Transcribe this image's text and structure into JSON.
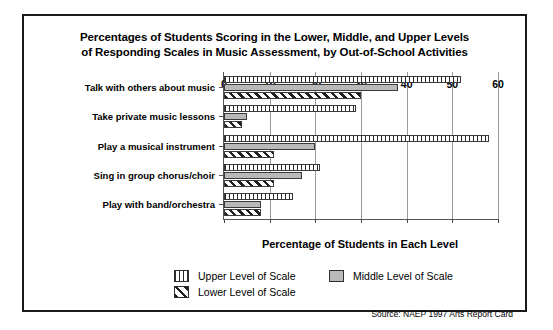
{
  "figure": {
    "title_line1": "Percentages of Students Scoring in the Lower, Middle, and Upper Levels",
    "title_line2": "of Responding Scales in Music Assessment, by Out-of-School Activities",
    "source": "Source: NAEP 1997 Arts Report Card"
  },
  "legend": {
    "upper": "Upper Level of Scale",
    "middle": "Middle Level of Scale",
    "lower": "Lower Level of Scale"
  },
  "colors": {
    "middle_fill": "#b9b9b9",
    "hatch_ink": "#2b2b2b",
    "frame": "#1a1a1a",
    "grid": "#9a9a9a"
  },
  "chart_data": {
    "type": "bar",
    "orientation": "horizontal",
    "title": "Percentages of Students Scoring in the Lower, Middle, and Upper Levels of Responding Scales in Music Assessment, by Out-of-School Activities",
    "xlabel": "Percentage of Students in Each Level",
    "ylabel": "",
    "xlim": [
      0,
      60
    ],
    "xticks": [
      0,
      10,
      20,
      30,
      40,
      50,
      60
    ],
    "xticklabels": [
      "0",
      "10",
      "20",
      "30",
      "40",
      "50",
      "60"
    ],
    "grid": "vertical",
    "legend_position": "below-plot",
    "categories": [
      "Talk with others about music",
      "Take private music lessons",
      "Play a musical instrument",
      "Sing in group chorus/choir",
      "Play with band/orchestra"
    ],
    "series": [
      {
        "name": "Upper Level of Scale",
        "values": [
          52,
          29,
          58,
          21,
          15
        ]
      },
      {
        "name": "Middle Level of Scale",
        "values": [
          38,
          5,
          20,
          17,
          8
        ]
      },
      {
        "name": "Lower Level of Scale",
        "values": [
          30,
          4,
          11,
          11,
          8
        ]
      }
    ]
  }
}
